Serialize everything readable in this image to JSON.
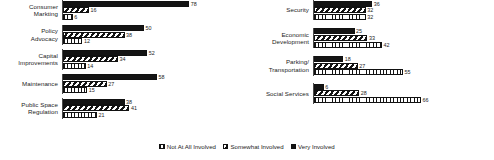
{
  "chart_data": {
    "type": "bar",
    "orientation": "horizontal",
    "title": "",
    "subtitle": "",
    "xlabel": "",
    "ylabel": "",
    "xlim": [
      0,
      100
    ],
    "grid": false,
    "legend_position": "bottom-center",
    "legend": [
      {
        "name": "Not At All Involved",
        "pattern": "vertical-hatch",
        "color": "#141414"
      },
      {
        "name": "Somewhat Involved",
        "pattern": "diagonal-hatch",
        "color": "#141414"
      },
      {
        "name": "Very Involved",
        "pattern": "solid",
        "color": "#141414"
      }
    ],
    "series": [
      {
        "name": "Very Involved",
        "values": [
          78,
          50,
          52,
          58,
          38,
          36,
          25,
          18,
          6
        ]
      },
      {
        "name": "Somewhat Involved",
        "values": [
          16,
          38,
          34,
          27,
          41,
          32,
          33,
          27,
          28
        ]
      },
      {
        "name": "Not At All Involved",
        "values": [
          6,
          12,
          14,
          15,
          21,
          32,
          42,
          55,
          66
        ]
      }
    ],
    "categories": [
      "Consumer Marketing",
      "Policy Advocacy",
      "Capital Improvements",
      "Maintenance",
      "Public Space Regulation",
      "Security",
      "Economic Development",
      "Parking/Transportation",
      "Social Services"
    ],
    "panels": [
      {
        "id": "left",
        "rows": [
          {
            "label_line1": "Consumer",
            "label_line2": "Markting",
            "very": 78,
            "somewhat": 16,
            "not_at_all": 6
          },
          {
            "label_line1": "Policy",
            "label_line2": "Advocacy",
            "very": 50,
            "somewhat": 38,
            "not_at_all": 12
          },
          {
            "label_line1": "Capital",
            "label_line2": "Improvements",
            "very": 52,
            "somewhat": 34,
            "not_at_all": 14
          },
          {
            "label_line1": "Maintenance",
            "label_line2": "",
            "very": 58,
            "somewhat": 27,
            "not_at_all": 15
          },
          {
            "label_line1": "Public Space",
            "label_line2": "Regulation",
            "very": 38,
            "somewhat": 41,
            "not_at_all": 21
          }
        ]
      },
      {
        "id": "right",
        "rows": [
          {
            "label_line1": "Security",
            "label_line2": "",
            "very": 36,
            "somewhat": 32,
            "not_at_all": 32
          },
          {
            "label_line1": "Economic",
            "label_line2": "Development",
            "very": 25,
            "somewhat": 33,
            "not_at_all": 42
          },
          {
            "label_line1": "Parking/",
            "label_line2": "Transportation",
            "very": 18,
            "somewhat": 27,
            "not_at_all": 55
          },
          {
            "label_line1": "Social Services",
            "label_line2": "",
            "very": 6,
            "somewhat": 28,
            "not_at_all": 66
          }
        ]
      }
    ]
  }
}
